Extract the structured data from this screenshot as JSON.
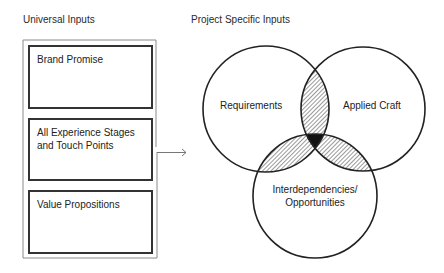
{
  "headings": {
    "universal": "Universal Inputs",
    "project": "Project Specific Inputs"
  },
  "universal_inputs": [
    {
      "label": "Brand Promise"
    },
    {
      "label": "All Experience Stages and Touch Points"
    },
    {
      "label": "Value Propositions"
    }
  ],
  "venn": {
    "circles": [
      {
        "label": "Requirements",
        "cx": 266,
        "cy": 109,
        "r": 63
      },
      {
        "label": "Applied Craft",
        "cx": 363,
        "cy": 109,
        "r": 62
      },
      {
        "label": "Interdependencies/ Opportunities",
        "label_line1": "Interdependencies/",
        "label_line2": "Opportunities",
        "cx": 315,
        "cy": 196,
        "r": 62
      }
    ],
    "pairwise_fill": "hatched",
    "triple_fill": "#111111"
  },
  "colors": {
    "stroke": "#222222",
    "outer_box": "#8a8a8a",
    "inner_box": "#333333",
    "arrow": "#777777"
  }
}
